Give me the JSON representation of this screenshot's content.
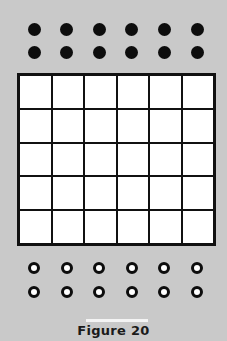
{
  "figure": {
    "caption": "Figure 20",
    "grid": {
      "columns": 6,
      "rows": 5
    },
    "filled_dots": {
      "rows": 2,
      "columns": 6,
      "color": "#0d0d0d"
    },
    "open_circles": {
      "rows": 2,
      "columns": 6
    },
    "background_color": "#c9c9c9"
  }
}
